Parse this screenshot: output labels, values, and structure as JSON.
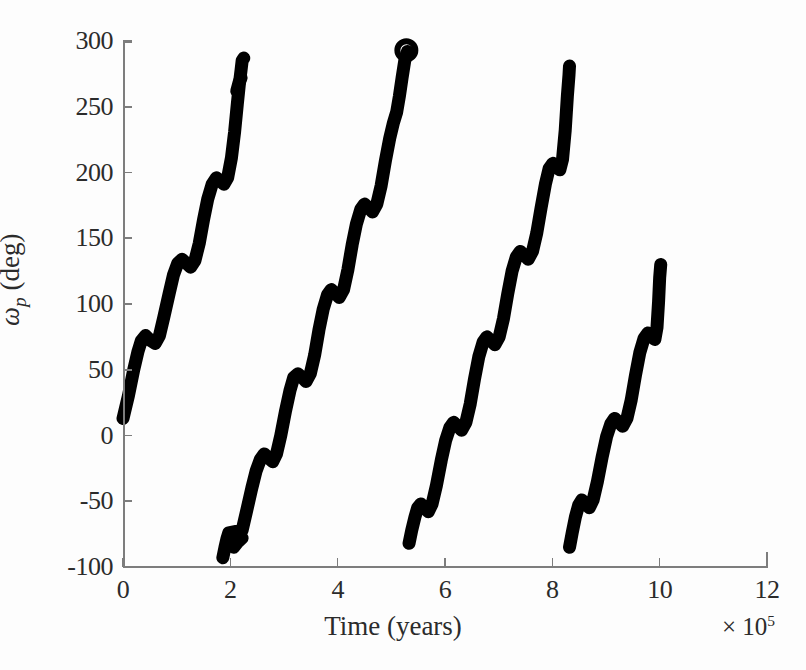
{
  "axes": {
    "x": {
      "title": "Time (years)",
      "exponent_prefix": "× 10",
      "exponent_power": "5",
      "ticks": [
        0,
        2,
        4,
        6,
        8,
        10,
        12
      ],
      "tick_labels": [
        "0",
        "2",
        "4",
        "6",
        "8",
        "10",
        "12"
      ],
      "min": 0,
      "max": 12
    },
    "y": {
      "title_symbol": "ω",
      "title_sub": "p",
      "title_units": "(deg)",
      "ticks": [
        -100,
        -50,
        0,
        50,
        100,
        150,
        200,
        250,
        300
      ],
      "tick_labels": [
        "-100",
        "-50",
        "0",
        "50",
        "100",
        "150",
        "200",
        "250",
        "300"
      ],
      "min": -100,
      "max": 300
    },
    "line_color": "#7d7d7d",
    "text_color": "#2b2b2b",
    "background": "#fdfdfd"
  },
  "chart_data": {
    "type": "line",
    "title": "",
    "xlabel": "Time (years) ×10⁵",
    "ylabel": "ω̄_p (deg)",
    "xlim": [
      0,
      12
    ],
    "ylim": [
      -100,
      300
    ],
    "grid": false,
    "legend": null,
    "series_color": "#000000",
    "line_width": 13,
    "marker": {
      "name": "ring-marker",
      "x": 5.28,
      "y": 293,
      "shape": "open-circle",
      "radius_px": 9
    },
    "series": [
      {
        "name": "branch-1",
        "x_start": 0.0,
        "x_end": 2.25,
        "y_start": 13,
        "y_end": 287,
        "points": [
          [
            0.0,
            13
          ],
          [
            0.1,
            30
          ],
          [
            0.2,
            50
          ],
          [
            0.28,
            64
          ],
          [
            0.34,
            72
          ],
          [
            0.42,
            76
          ],
          [
            0.52,
            72
          ],
          [
            0.6,
            70
          ],
          [
            0.68,
            76
          ],
          [
            0.76,
            90
          ],
          [
            0.86,
            108
          ],
          [
            0.94,
            122
          ],
          [
            1.02,
            131
          ],
          [
            1.1,
            134
          ],
          [
            1.18,
            131
          ],
          [
            1.26,
            128
          ],
          [
            1.34,
            133
          ],
          [
            1.42,
            146
          ],
          [
            1.5,
            164
          ],
          [
            1.58,
            180
          ],
          [
            1.66,
            191
          ],
          [
            1.74,
            196
          ],
          [
            1.8,
            194
          ],
          [
            1.88,
            191
          ],
          [
            1.95,
            196
          ],
          [
            2.02,
            211
          ],
          [
            2.08,
            231
          ],
          [
            2.13,
            252
          ],
          [
            2.17,
            268
          ],
          [
            2.2,
            278
          ],
          [
            2.22,
            285
          ],
          [
            2.25,
            287
          ]
        ]
      },
      {
        "name": "branch-1-tail",
        "x_start": 2.12,
        "x_end": 2.22,
        "y_start": 262,
        "y_end": 272,
        "points": [
          [
            2.12,
            262
          ],
          [
            2.16,
            268
          ],
          [
            2.2,
            272
          ]
        ]
      },
      {
        "name": "branch-2",
        "x_start": 1.86,
        "x_end": 5.3,
        "y_start": -93,
        "y_end": 292,
        "points": [
          [
            1.86,
            -93
          ],
          [
            1.9,
            -85
          ],
          [
            1.94,
            -78
          ],
          [
            1.97,
            -74
          ],
          [
            2.22,
            -72
          ],
          [
            2.3,
            -58
          ],
          [
            2.4,
            -40
          ],
          [
            2.48,
            -27
          ],
          [
            2.56,
            -18
          ],
          [
            2.63,
            -14
          ],
          [
            2.71,
            -17
          ],
          [
            2.79,
            -20
          ],
          [
            2.86,
            -14
          ],
          [
            2.94,
            0
          ],
          [
            3.03,
            19
          ],
          [
            3.11,
            34
          ],
          [
            3.18,
            44
          ],
          [
            3.26,
            47
          ],
          [
            3.34,
            44
          ],
          [
            3.41,
            41
          ],
          [
            3.49,
            47
          ],
          [
            3.57,
            61
          ],
          [
            3.65,
            80
          ],
          [
            3.73,
            96
          ],
          [
            3.81,
            107
          ],
          [
            3.88,
            111
          ],
          [
            3.96,
            108
          ],
          [
            4.03,
            105
          ],
          [
            4.11,
            111
          ],
          [
            4.19,
            126
          ],
          [
            4.27,
            145
          ],
          [
            4.35,
            161
          ],
          [
            4.43,
            172
          ],
          [
            4.5,
            176
          ],
          [
            4.58,
            173
          ],
          [
            4.65,
            170
          ],
          [
            4.73,
            176
          ],
          [
            4.81,
            190
          ],
          [
            4.89,
            209
          ],
          [
            4.97,
            226
          ],
          [
            5.04,
            238
          ],
          [
            5.1,
            246
          ],
          [
            5.15,
            258
          ],
          [
            5.2,
            272
          ],
          [
            5.25,
            285
          ],
          [
            5.3,
            292
          ]
        ]
      },
      {
        "name": "branch-2-tail",
        "x_start": 2.06,
        "x_end": 2.22,
        "y_start": -85,
        "y_end": -78,
        "points": [
          [
            2.06,
            -85
          ],
          [
            2.14,
            -81
          ],
          [
            2.22,
            -78
          ]
        ]
      },
      {
        "name": "branch-3",
        "x_start": 5.33,
        "x_end": 8.32,
        "y_start": -82,
        "y_end": 281,
        "points": [
          [
            5.33,
            -82
          ],
          [
            5.38,
            -72
          ],
          [
            5.44,
            -62
          ],
          [
            5.49,
            -55
          ],
          [
            5.55,
            -52
          ],
          [
            5.62,
            -55
          ],
          [
            5.69,
            -58
          ],
          [
            5.76,
            -52
          ],
          [
            5.84,
            -38
          ],
          [
            5.93,
            -19
          ],
          [
            6.01,
            -4
          ],
          [
            6.09,
            6
          ],
          [
            6.16,
            10
          ],
          [
            6.24,
            7
          ],
          [
            6.31,
            4
          ],
          [
            6.39,
            10
          ],
          [
            6.47,
            24
          ],
          [
            6.55,
            43
          ],
          [
            6.63,
            60
          ],
          [
            6.71,
            71
          ],
          [
            6.78,
            75
          ],
          [
            6.86,
            72
          ],
          [
            6.93,
            69
          ],
          [
            7.01,
            75
          ],
          [
            7.09,
            89
          ],
          [
            7.17,
            108
          ],
          [
            7.25,
            125
          ],
          [
            7.33,
            136
          ],
          [
            7.4,
            140
          ],
          [
            7.48,
            137
          ],
          [
            7.55,
            134
          ],
          [
            7.63,
            140
          ],
          [
            7.71,
            154
          ],
          [
            7.79,
            173
          ],
          [
            7.87,
            191
          ],
          [
            7.94,
            203
          ],
          [
            8.01,
            207
          ],
          [
            8.08,
            204
          ],
          [
            8.14,
            202
          ],
          [
            8.19,
            210
          ],
          [
            8.24,
            232
          ],
          [
            8.28,
            258
          ],
          [
            8.31,
            274
          ],
          [
            8.32,
            281
          ]
        ]
      },
      {
        "name": "branch-4",
        "x_start": 8.32,
        "x_end": 10.02,
        "y_start": -85,
        "y_end": 130,
        "points": [
          [
            8.32,
            -85
          ],
          [
            8.37,
            -74
          ],
          [
            8.43,
            -62
          ],
          [
            8.49,
            -53
          ],
          [
            8.55,
            -49
          ],
          [
            8.62,
            -52
          ],
          [
            8.69,
            -55
          ],
          [
            8.76,
            -49
          ],
          [
            8.84,
            -35
          ],
          [
            8.93,
            -16
          ],
          [
            9.01,
            -1
          ],
          [
            9.09,
            9
          ],
          [
            9.16,
            13
          ],
          [
            9.24,
            10
          ],
          [
            9.31,
            7
          ],
          [
            9.39,
            13
          ],
          [
            9.47,
            27
          ],
          [
            9.55,
            46
          ],
          [
            9.63,
            63
          ],
          [
            9.71,
            74
          ],
          [
            9.78,
            78
          ],
          [
            9.85,
            75
          ],
          [
            9.91,
            73
          ],
          [
            9.95,
            82
          ],
          [
            9.98,
            102
          ],
          [
            10.0,
            120
          ],
          [
            10.02,
            130
          ]
        ]
      }
    ]
  }
}
